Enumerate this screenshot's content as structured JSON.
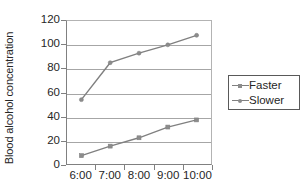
{
  "chart_data": {
    "type": "line",
    "title": "",
    "xlabel": "",
    "ylabel": "Blood alcohol concentration",
    "categories": [
      "6:00",
      "7:00",
      "8:00",
      "9:00",
      "10:00"
    ],
    "yticks": [
      0,
      20,
      40,
      60,
      80,
      100,
      120
    ],
    "ylim": [
      0,
      120
    ],
    "grid": true,
    "legend_position": "right",
    "series": [
      {
        "name": "Faster",
        "marker": "diamond",
        "color": "#808080",
        "values": [
          7,
          15,
          22,
          31,
          37
        ]
      },
      {
        "name": "Slower",
        "marker": "circle",
        "color": "#808080",
        "values": [
          54,
          85,
          93,
          100,
          108
        ]
      }
    ]
  },
  "legend": {
    "items": [
      {
        "label": "Faster"
      },
      {
        "label": "Slower"
      }
    ]
  },
  "colors": {
    "line": "#808080",
    "grid": "#a6a6a6",
    "axis": "#808080",
    "text": "#262626",
    "plot_background": "#ffffff"
  }
}
